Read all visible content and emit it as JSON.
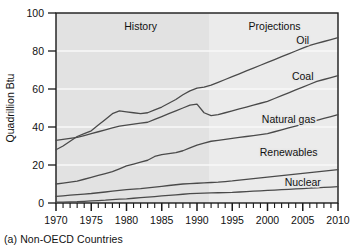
{
  "figure": {
    "caption": "(a) Non-OECD Countries"
  },
  "chart_data": {
    "type": "line",
    "title": "",
    "xlabel": "",
    "ylabel": "Quadrillion Btu",
    "xlim": [
      1970,
      2010
    ],
    "ylim": [
      0,
      100
    ],
    "xticks": [
      1970,
      1975,
      1980,
      1985,
      1990,
      1995,
      2000,
      2005,
      2010
    ],
    "xtick_labels": [
      "1970",
      "1975",
      "1980",
      "1985",
      "1990",
      "1995",
      "2000",
      "2005",
      "2010"
    ],
    "minor_xtick_interval": 1,
    "yticks": [
      0,
      20,
      40,
      60,
      80,
      100
    ],
    "ytick_labels": [
      "0",
      "20",
      "40",
      "60",
      "80",
      "100"
    ],
    "grid": "horizontal",
    "legend": "inline-right-labels",
    "annotations": [
      {
        "name": "history-label",
        "text": "History",
        "x": 1982,
        "y": 93
      },
      {
        "name": "projections-label",
        "text": "Projections",
        "x": 2001,
        "y": 93
      }
    ],
    "history_projection_split_year": 1997,
    "x": [
      1970,
      1971,
      1972,
      1973,
      1974,
      1975,
      1976,
      1977,
      1978,
      1979,
      1980,
      1981,
      1982,
      1983,
      1984,
      1985,
      1986,
      1987,
      1988,
      1989,
      1990,
      1991,
      1992,
      1993,
      1994,
      1995,
      1996,
      1997,
      1998,
      1999,
      2000,
      2001,
      2002,
      2003,
      2004,
      2005,
      2006,
      2007,
      2008,
      2009,
      2010
    ],
    "series": [
      {
        "name": "Oil",
        "label": "Oil",
        "label_x": 2005,
        "label_y": 86,
        "values": [
          28,
          30,
          32.5,
          35,
          36.5,
          38,
          41,
          44,
          47,
          48.5,
          48,
          47.5,
          47,
          47.5,
          49,
          50.5,
          52.5,
          54.5,
          57,
          59,
          60.5,
          61,
          62,
          63.5,
          65,
          66.5,
          68,
          69.5,
          71,
          72.5,
          74,
          75.5,
          77,
          78.5,
          80,
          81.5,
          83,
          84,
          85,
          86,
          87
        ]
      },
      {
        "name": "Coal",
        "label": "Coal",
        "label_x": 2005,
        "label_y": 67,
        "values": [
          33,
          33.5,
          34,
          34.5,
          35.5,
          36.5,
          37.5,
          38.5,
          39.5,
          40.5,
          41,
          41.5,
          42,
          42.5,
          44,
          45.5,
          47,
          48.5,
          50,
          51.5,
          52,
          47.5,
          46,
          46.5,
          47.5,
          48.5,
          49.5,
          50.5,
          51.5,
          52.5,
          53.5,
          55,
          56.5,
          58,
          59.5,
          61,
          62.5,
          64,
          65,
          66,
          67
        ]
      },
      {
        "name": "Natural gas",
        "label": "Natural gas",
        "label_x": 2003,
        "label_y": 44,
        "values": [
          10,
          10.5,
          11,
          11.5,
          12.5,
          13.5,
          14.5,
          15.5,
          16.5,
          18,
          19.5,
          20.5,
          21.5,
          22.5,
          24.5,
          25.5,
          26,
          26.5,
          27.5,
          29,
          30.5,
          31.5,
          32.5,
          33,
          33.5,
          34,
          34.5,
          35,
          35.5,
          36,
          36.5,
          37.5,
          38.5,
          39.5,
          40.5,
          41.5,
          42.5,
          43.5,
          44.5,
          45.5,
          46.5
        ]
      },
      {
        "name": "Renewables",
        "label": "Renewables",
        "label_x": 2003,
        "label_y": 27,
        "values": [
          3.5,
          3.8,
          4.1,
          4.4,
          4.7,
          5,
          5.4,
          5.8,
          6.2,
          6.6,
          7,
          7.3,
          7.6,
          8,
          8.4,
          8.8,
          9.2,
          9.6,
          10,
          10.2,
          10.4,
          10.6,
          10.8,
          11,
          11.3,
          11.6,
          12,
          12.4,
          12.8,
          13.2,
          13.6,
          14,
          14.4,
          14.8,
          15.2,
          15.6,
          16,
          16.4,
          16.8,
          17.2,
          17.6
        ]
      },
      {
        "name": "Nuclear",
        "label": "Nuclear",
        "label_x": 2005,
        "label_y": 11,
        "values": [
          0.4,
          0.5,
          0.6,
          0.7,
          0.9,
          1.1,
          1.3,
          1.5,
          1.8,
          2,
          2.2,
          2.5,
          2.8,
          3.1,
          3.4,
          3.7,
          4,
          4.3,
          4.6,
          4.9,
          5.1,
          5.2,
          5.3,
          5.4,
          5.5,
          5.6,
          5.8,
          6,
          6.2,
          6.4,
          6.6,
          6.8,
          7,
          7.2,
          7.4,
          7.6,
          7.8,
          8,
          8.2,
          8.4,
          8.6
        ]
      }
    ]
  },
  "colors": {
    "plot_history_bg": "#e2e2e2",
    "plot_projection_bg": "#eaeaea",
    "gridline": "#f7f7f7",
    "line": "#4a4a4a",
    "axis": "#1a1a1a",
    "text": "#111111"
  }
}
